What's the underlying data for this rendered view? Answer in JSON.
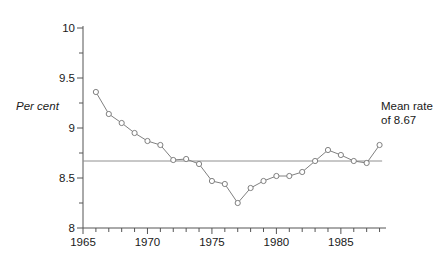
{
  "chart_data": {
    "type": "line",
    "title": "",
    "xlabel": "",
    "ylabel": "Per cent",
    "xlim": [
      1965,
      1988.5
    ],
    "ylim": [
      8,
      10
    ],
    "grid": false,
    "legend": "none",
    "x": [
      1966,
      1967,
      1968,
      1969,
      1970,
      1971,
      1972,
      1973,
      1974,
      1975,
      1976,
      1977,
      1978,
      1979,
      1980,
      1981,
      1982,
      1983,
      1984,
      1985,
      1986,
      1987,
      1988
    ],
    "values": [
      9.36,
      9.14,
      9.05,
      8.95,
      8.87,
      8.83,
      8.68,
      8.69,
      8.64,
      8.47,
      8.44,
      8.25,
      8.4,
      8.47,
      8.52,
      8.52,
      8.56,
      8.67,
      8.78,
      8.73,
      8.67,
      8.65,
      8.83
    ],
    "series": [
      {
        "name": "rate",
        "values": [
          9.36,
          9.14,
          9.05,
          8.95,
          8.87,
          8.83,
          8.68,
          8.69,
          8.64,
          8.47,
          8.44,
          8.25,
          8.4,
          8.47,
          8.52,
          8.52,
          8.56,
          8.67,
          8.78,
          8.73,
          8.67,
          8.65,
          8.83
        ]
      }
    ],
    "reference_line": {
      "label": "Mean rate of 8.67",
      "value": 8.67,
      "x_start": 1965,
      "x_end": 1988.2
    },
    "y_ticks_major": [
      8,
      8.5,
      9,
      9.5,
      10
    ],
    "y_tick_labels": [
      "8",
      "8.5",
      "9",
      "9.5",
      "10"
    ],
    "y_ticks_minor": [
      8.25,
      8.75,
      9.25,
      9.75
    ],
    "x_ticks_major": [
      1965,
      1970,
      1975,
      1980,
      1985
    ],
    "x_tick_labels": [
      "1965",
      "1970",
      "1975",
      "1980",
      "1985"
    ],
    "x_ticks_minor": [
      1966,
      1967,
      1968,
      1969,
      1971,
      1972,
      1973,
      1974,
      1976,
      1977,
      1978,
      1979,
      1981,
      1982,
      1983,
      1984,
      1986,
      1987,
      1988
    ],
    "marker": "open-circle",
    "line_color": "#808080",
    "marker_color": "#808080",
    "axis_color": "#555555",
    "mean_line_color": "#909090"
  },
  "annotation": {
    "line1": "Mean rate",
    "line2": "of 8.67"
  },
  "axis": {
    "y_title": "Per cent"
  }
}
